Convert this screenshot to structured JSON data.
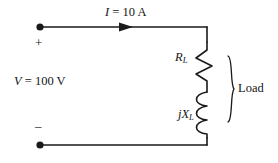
{
  "figure": {
    "name": "ac-circuit-source-and-rl-load",
    "background_color": "#ffffff",
    "line_color": "#1a1a1a",
    "text_color": "#141414"
  },
  "labels": {
    "current": {
      "symbol": "I",
      "equals": " = ",
      "value": "10",
      "unit": " A",
      "full": "I = 10 A"
    },
    "voltage": {
      "symbol": "V",
      "equals": " = ",
      "value": "100",
      "unit": " V",
      "full": "V = 100 V"
    },
    "resistor": {
      "symbol": "R",
      "subscript": "L",
      "full": "R_L"
    },
    "reactance": {
      "symbol": "jX",
      "subscript": "L",
      "full": "jX_L"
    },
    "load": "Load",
    "polarity_positive": "+",
    "polarity_negative": "–"
  },
  "components": {
    "resistor": {
      "type": "zigzag-resistor",
      "label": "R_L"
    },
    "inductor": {
      "type": "coil-inductor",
      "label": "jX_L",
      "loops": 3
    },
    "source_terminals": {
      "top": "positive",
      "bottom": "negative"
    },
    "current_arrow": {
      "direction": "right",
      "label": "I = 10 A"
    },
    "load_bracket": {
      "label": "Load",
      "orientation": "vertical-right"
    }
  }
}
